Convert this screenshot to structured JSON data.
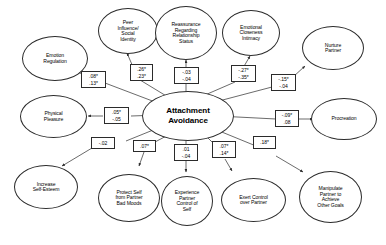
{
  "diagram": {
    "title_node": {
      "label": "Attachment Avoidance",
      "line1": "Attachment",
      "line2": "Avoidance"
    },
    "nodes": [
      {
        "id": "emotion-regulation",
        "label": "Emotion Regulation",
        "lines": [
          "Emotion",
          "Regulation"
        ]
      },
      {
        "id": "peer-influence-social-identity",
        "label": "Peer Influence/ Social Identity",
        "lines": [
          "Peer",
          "Influence/",
          "Social",
          "Identity"
        ]
      },
      {
        "id": "reassurance-regarding-relationship-status",
        "label": "Reassurance Regarding Relationship Status",
        "lines": [
          "Reassurance",
          "Regarding",
          "Relationship",
          "Status"
        ]
      },
      {
        "id": "emotional-closeness-intimacy",
        "label": "Emotional Closeness Intimacy",
        "lines": [
          "Emotional",
          "Closeness",
          "Intimacy"
        ]
      },
      {
        "id": "nurture-partner",
        "label": "Nurture Partner",
        "lines": [
          "Nurture",
          "Partner"
        ]
      },
      {
        "id": "physical-pleasure",
        "label": "Physical Pleasure",
        "lines": [
          "Physical",
          "Pleasure"
        ]
      },
      {
        "id": "procreation",
        "label": "Procreation",
        "lines": [
          "Procreation"
        ]
      },
      {
        "id": "increase-self-esteem",
        "label": "Increase Self-Esteem",
        "lines": [
          "Increase",
          "Self-Esteem"
        ]
      },
      {
        "id": "protect-self-from-partner-bad-moods",
        "label": "Protect Self from Partner Bad Moods",
        "lines": [
          "Protect Self",
          "from Partner",
          "Bad Moods"
        ]
      },
      {
        "id": "experience-partner-control-of-self",
        "label": "Experience Partner Control of Self",
        "lines": [
          "Experience",
          "Partner",
          "Control of",
          "Self"
        ]
      },
      {
        "id": "exert-control-over-partner",
        "label": "Exert Control over Partner",
        "lines": [
          "Exert Control",
          "over Partner"
        ]
      },
      {
        "id": "manipulate-partner-to-achieve-other-goals",
        "label": "Manipulate Partner to Achieve Other Goals",
        "lines": [
          "Manipulate",
          "Partner to",
          "Achieve",
          "Other Goals"
        ]
      }
    ],
    "coefficients": [
      {
        "id": "coef-emotion-regulation",
        "target": "emotion-regulation",
        "values": [
          ".08*",
          ".13*"
        ]
      },
      {
        "id": "coef-peer-influence",
        "target": "peer-influence-social-identity",
        "values": [
          ".26*",
          ".23*"
        ]
      },
      {
        "id": "coef-reassurance",
        "target": "reassurance-regarding-relationship-status",
        "values": [
          "-.03",
          "-.04"
        ]
      },
      {
        "id": "coef-emotional-closeness",
        "target": "emotional-closeness-intimacy",
        "values": [
          "-.27*",
          "-.35*"
        ]
      },
      {
        "id": "coef-nurture-partner",
        "target": "nurture-partner",
        "values": [
          "-.15*",
          "-.04"
        ]
      },
      {
        "id": "coef-physical-pleasure",
        "target": "physical-pleasure",
        "values": [
          ".05*",
          "-.05"
        ]
      },
      {
        "id": "coef-procreation",
        "target": "procreation",
        "values": [
          "-.09*",
          ".08"
        ]
      },
      {
        "id": "coef-increase-self-esteem",
        "target": "increase-self-esteem",
        "values": [
          "-.02"
        ]
      },
      {
        "id": "coef-protect-self",
        "target": "protect-self-from-partner-bad-moods",
        "values": [
          ".07*"
        ]
      },
      {
        "id": "coef-experience-partner-control",
        "target": "experience-partner-control-of-self",
        "values": [
          ".01",
          "-.04"
        ]
      },
      {
        "id": "coef-exert-control",
        "target": "exert-control-over-partner",
        "values": [
          ".07*",
          ".14*"
        ]
      },
      {
        "id": "coef-manipulate-partner",
        "target": "manipulate-partner-to-achieve-other-goals",
        "values": [
          ".18*"
        ]
      }
    ],
    "colors": {
      "stroke": "#2b2b2b",
      "background": "#ffffff",
      "text": "#000000"
    }
  }
}
